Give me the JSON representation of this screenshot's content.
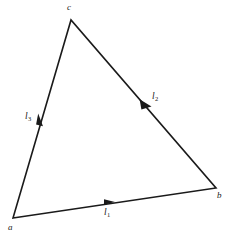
{
  "figure": {
    "type": "geometry-diagram",
    "background_color": "#ffffff",
    "stroke_color": "#1a1a1a",
    "text_color": "#1a1a1a",
    "stroke_width": 1.6
  },
  "vertices": [
    {
      "id": "a",
      "label": "a",
      "x": 13,
      "y": 218
    },
    {
      "id": "b",
      "label": "b",
      "x": 216,
      "y": 188
    },
    {
      "id": "c",
      "label": "c",
      "x": 71,
      "y": 20
    }
  ],
  "edges": [
    {
      "id": "l1",
      "label": "l",
      "subscript": "1",
      "from": "a",
      "to": "b",
      "arrow_x": 110,
      "arrow_y": 202,
      "arrow_direction": "right"
    },
    {
      "id": "l2",
      "label": "l",
      "subscript": "2",
      "from": "c",
      "to": "b",
      "arrow_x": 145,
      "arrow_y": 104,
      "arrow_direction": "down-right"
    },
    {
      "id": "l3",
      "label": "l",
      "subscript": "3",
      "from": "c",
      "to": "a",
      "arrow_x": 41,
      "arrow_y": 120,
      "arrow_direction": "down-left"
    }
  ],
  "paths": {
    "triangle": "M 13 218 L 216 188 L 71 20 Z"
  },
  "arrow_markers": {
    "l1": "M 104 199.3 L 115 202.0 L 104 204.7 Z",
    "l2": "M 139.6 99.2 L 151.5 106.5 L 141.4 109.6 Z",
    "l3": "M 38.2 113.6 L 43.0 126.2 L 36.1 124.4 Z"
  }
}
